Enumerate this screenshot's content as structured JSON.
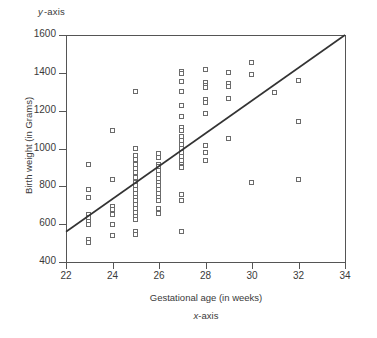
{
  "chart_data": {
    "type": "scatter",
    "title": "",
    "xlabel": "Gestational age (in weeks)",
    "ylabel": "Birth weight (in Grams)",
    "x_axis_note": "x-axis",
    "y_axis_note": "y-axis",
    "xlim": [
      22,
      34
    ],
    "ylim": [
      400,
      1600
    ],
    "xticks": [
      22,
      24,
      26,
      28,
      30,
      32,
      34
    ],
    "yticks": [
      400,
      600,
      800,
      1000,
      1200,
      1400,
      1600
    ],
    "grid": false,
    "legend": "none",
    "marker": "open-square",
    "marker_color": "#6b6b6b",
    "trend_line": {
      "type": "linear-fit",
      "x_start": 22,
      "y_start": 560,
      "x_end": 34,
      "y_end": 1600,
      "color": "#333333"
    },
    "points": [
      [
        23,
        915
      ],
      [
        23,
        780
      ],
      [
        23,
        740
      ],
      [
        23,
        650
      ],
      [
        23,
        630
      ],
      [
        23,
        610
      ],
      [
        23,
        595
      ],
      [
        23,
        515
      ],
      [
        23,
        500
      ],
      [
        24,
        1095
      ],
      [
        24,
        835
      ],
      [
        24,
        690
      ],
      [
        24,
        675
      ],
      [
        24,
        650
      ],
      [
        24,
        595
      ],
      [
        24,
        535
      ],
      [
        25,
        1300
      ],
      [
        25,
        1000
      ],
      [
        25,
        960
      ],
      [
        25,
        940
      ],
      [
        25,
        915
      ],
      [
        25,
        890
      ],
      [
        25,
        870
      ],
      [
        25,
        845
      ],
      [
        25,
        820
      ],
      [
        25,
        800
      ],
      [
        25,
        780
      ],
      [
        25,
        760
      ],
      [
        25,
        740
      ],
      [
        25,
        720
      ],
      [
        25,
        700
      ],
      [
        25,
        680
      ],
      [
        25,
        660
      ],
      [
        25,
        640
      ],
      [
        25,
        620
      ],
      [
        25,
        560
      ],
      [
        25,
        545
      ],
      [
        26,
        970
      ],
      [
        26,
        950
      ],
      [
        26,
        915
      ],
      [
        26,
        900
      ],
      [
        26,
        880
      ],
      [
        26,
        860
      ],
      [
        26,
        840
      ],
      [
        26,
        820
      ],
      [
        26,
        800
      ],
      [
        26,
        780
      ],
      [
        26,
        760
      ],
      [
        26,
        740
      ],
      [
        26,
        720
      ],
      [
        26,
        680
      ],
      [
        26,
        655
      ],
      [
        27,
        1405
      ],
      [
        27,
        1395
      ],
      [
        27,
        1350
      ],
      [
        27,
        1300
      ],
      [
        27,
        1225
      ],
      [
        27,
        1165
      ],
      [
        27,
        1110
      ],
      [
        27,
        1090
      ],
      [
        27,
        1060
      ],
      [
        27,
        1040
      ],
      [
        27,
        1020
      ],
      [
        27,
        1000
      ],
      [
        27,
        975
      ],
      [
        27,
        955
      ],
      [
        27,
        935
      ],
      [
        27,
        915
      ],
      [
        27,
        900
      ],
      [
        27,
        895
      ],
      [
        27,
        755
      ],
      [
        27,
        720
      ],
      [
        27,
        560
      ],
      [
        28,
        1415
      ],
      [
        28,
        1345
      ],
      [
        28,
        1330
      ],
      [
        28,
        1320
      ],
      [
        28,
        1255
      ],
      [
        28,
        1240
      ],
      [
        28,
        1185
      ],
      [
        28,
        1015
      ],
      [
        28,
        975
      ],
      [
        28,
        935
      ],
      [
        29,
        1400
      ],
      [
        29,
        1340
      ],
      [
        29,
        1325
      ],
      [
        29,
        1260
      ],
      [
        29,
        1050
      ],
      [
        30,
        1450
      ],
      [
        30,
        1390
      ],
      [
        30,
        820
      ],
      [
        31,
        1295
      ],
      [
        32,
        1355
      ],
      [
        32,
        1140
      ],
      [
        32,
        835
      ]
    ]
  }
}
